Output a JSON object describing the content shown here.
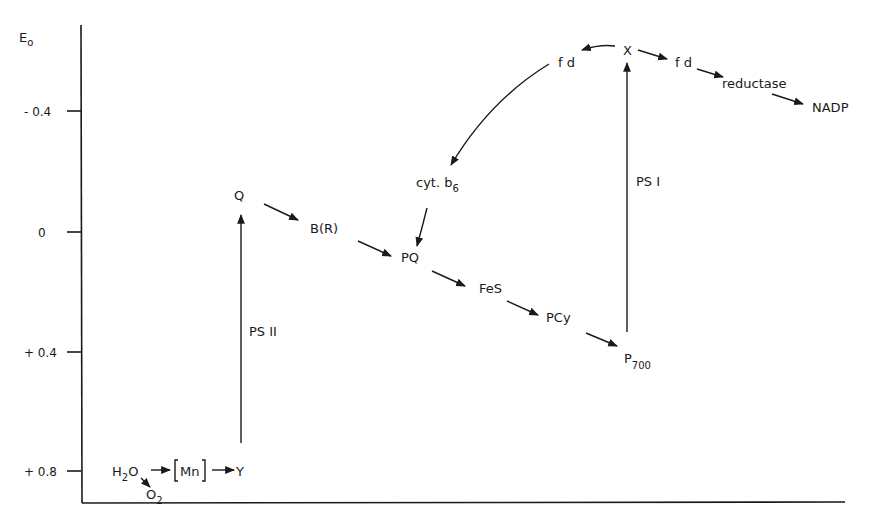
{
  "axis": {
    "y_label": "E",
    "y_label_sub": "o",
    "ticks": [
      {
        "label": "- 0.4",
        "value": -0.4
      },
      {
        "label": "0",
        "value": 0
      },
      {
        "label": "+ 0.4",
        "value": 0.4
      },
      {
        "label": "+ 0.8",
        "value": 0.8
      }
    ]
  },
  "components": {
    "h2o_main": "H",
    "h2o_sub": "2",
    "h2o_tail": "O",
    "o2_main": "O",
    "o2_sub": "2",
    "mn": "Mn",
    "y": "Y",
    "q": "Q",
    "br": "B(R)",
    "pq": "PQ",
    "fes": "FeS",
    "pcy": "PCy",
    "p700_main": "P",
    "p700_sub": "700",
    "x": "X",
    "fd_cyclic": "f d",
    "fd_forward": "f d",
    "reductase": "reductase",
    "nadp": "NADP",
    "cytb6_main": "cyt. b",
    "cytb6_sub": "6"
  },
  "photosystems": {
    "ps2": "PS II",
    "ps1": "PS I"
  }
}
